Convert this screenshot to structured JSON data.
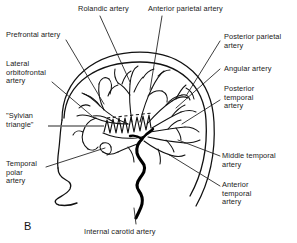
{
  "figure": {
    "panel_letter": "B",
    "background_color": "#ffffff",
    "ink_color": "#111111",
    "leader_line_color": "#1a1a1a",
    "sylvian_leader_color": "#6e6e6e",
    "carotid_color": "#000000"
  },
  "labels": {
    "rolandic": "Rolandic artery",
    "anterior_parietal": "Anterior parietal artery",
    "prefrontal": "Prefrontal artery",
    "lateral_orbitofrontal": "Lateral\norbitofrontal\nartery",
    "sylvian_triangle": "\"Sylvian\ntriangle\"",
    "temporal_polar": "Temporal\npolar\nartery",
    "posterior_parietal": "Posterior parietal\nartery",
    "angular": "Angular artery",
    "posterior_temporal": "Posterior\ntemporal\nartery",
    "middle_temporal": "Middle temporal\nartery",
    "anterior_temporal": "Anterior\ntemporal\nartery",
    "internal_carotid": "Internal carotid artery"
  }
}
